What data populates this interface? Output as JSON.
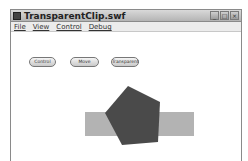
{
  "window": {
    "title": "TransparentClip.swf",
    "controls": [
      "minimize",
      "maximize",
      "close"
    ],
    "control_glyphs": [
      "_",
      "□",
      "×"
    ]
  },
  "menu": {
    "items": [
      {
        "label": "File"
      },
      {
        "label": "View"
      },
      {
        "label": "Control"
      },
      {
        "label": "Debug"
      }
    ]
  },
  "stage": {
    "buttons": [
      {
        "label": "Control"
      },
      {
        "label": "Move"
      },
      {
        "label": "Transparent"
      }
    ],
    "shapes": {
      "rectangle": {
        "color": "#b3b3b3"
      },
      "pentagon": {
        "color": "#4a4a4a"
      }
    }
  }
}
